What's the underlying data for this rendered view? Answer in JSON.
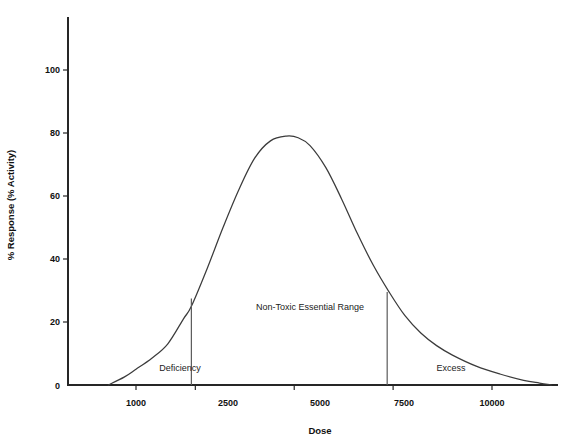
{
  "chart_data": {
    "type": "line",
    "title": "",
    "xlabel": "Dose",
    "ylabel": "% Response (% Activity)",
    "xlim": [
      0,
      12000
    ],
    "ylim": [
      0,
      110
    ],
    "grid": false,
    "legend": "none",
    "x_ticks": [
      {
        "value": 1000,
        "label": "1000"
      },
      {
        "value": 2500,
        "label": "2500"
      },
      {
        "value": 5000,
        "label": "5000"
      },
      {
        "value": 7500,
        "label": "7500"
      },
      {
        "value": 10000,
        "label": "10000"
      }
    ],
    "y_ticks": [
      {
        "value": 0,
        "label": "0"
      },
      {
        "value": 20,
        "label": "20"
      },
      {
        "value": 40,
        "label": "40"
      },
      {
        "value": 60,
        "label": "60"
      },
      {
        "value": 80,
        "label": "80"
      },
      {
        "value": 100,
        "label": "100"
      }
    ],
    "series": [
      {
        "name": "dose-response",
        "x": [
          300,
          700,
          1000,
          1400,
          1800,
          2200,
          2400,
          2800,
          3200,
          3600,
          4000,
          4400,
          4800,
          5100,
          5400,
          5800,
          6200,
          6600,
          7000,
          7400,
          7800,
          8200,
          8600,
          9000,
          9600,
          10200,
          10800,
          11200,
          11500
        ],
        "y": [
          0,
          2.5,
          5,
          8.5,
          13,
          21,
          25,
          37,
          50,
          62,
          72,
          77.5,
          79,
          78.5,
          76,
          69,
          59,
          48,
          38,
          29.5,
          22,
          16.5,
          12.5,
          9.5,
          6,
          3.5,
          1.5,
          0.6,
          0
        ]
      }
    ],
    "annotations": [
      {
        "name": "deficiency",
        "text": "Deficiency",
        "x": 1900,
        "y": 5.5
      },
      {
        "name": "non-toxic-essential-range",
        "text": "Non-Toxic Essential Range",
        "x": 4950,
        "y": 24
      },
      {
        "name": "excess",
        "text": "Excess",
        "x": 8900,
        "y": 5.5
      }
    ],
    "boundary_lines": [
      {
        "name": "deficiency-boundary",
        "x": 2400,
        "y_top": 27.5
      },
      {
        "name": "excess-boundary",
        "x": 7350,
        "y_top": 29.5
      }
    ],
    "peak": {
      "x": 4800,
      "y": 79
    },
    "colors": {
      "curve": "#3b3b3b",
      "axis": "#262626",
      "divider": "#5b5b5b",
      "text": "#111111",
      "background": "#ffffff"
    }
  }
}
